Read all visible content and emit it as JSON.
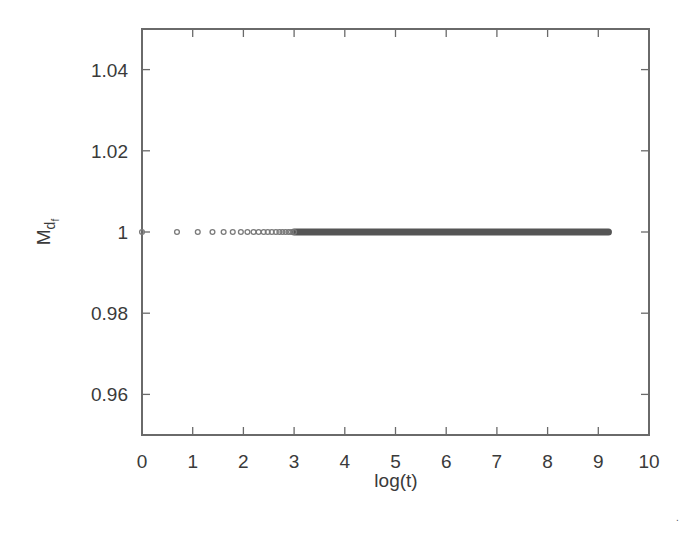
{
  "chart_data": {
    "type": "scatter",
    "title": "",
    "xlabel": "log(t)",
    "ylabel": "M_{d_f}",
    "ylabel_main": "M",
    "ylabel_sub": "d",
    "ylabel_subsub": "f",
    "xlim": [
      0,
      10
    ],
    "ylim": [
      0.95,
      1.05
    ],
    "xticks": [
      0,
      1,
      2,
      3,
      4,
      5,
      6,
      7,
      8,
      9,
      10
    ],
    "xtick_labels": [
      "0",
      "1",
      "2",
      "3",
      "4",
      "5",
      "6",
      "7",
      "8",
      "9",
      "10"
    ],
    "yticks": [
      0.96,
      0.98,
      1.0,
      1.02,
      1.04
    ],
    "ytick_labels": [
      "0.96",
      "0.98",
      "1",
      "1.02",
      "1.04"
    ],
    "grid": false,
    "legend": null,
    "series": [
      {
        "name": "M_df",
        "marker": "open-circle",
        "x": [
          0.0,
          0.69,
          1.1,
          1.39,
          1.61,
          1.79,
          1.95,
          2.08,
          2.2,
          2.3,
          2.4,
          2.48,
          2.56,
          2.64,
          2.71,
          2.77,
          2.83,
          2.89,
          2.94,
          3.0
        ],
        "y": [
          1,
          1,
          1,
          1,
          1,
          1,
          1,
          1,
          1,
          1,
          1,
          1,
          1,
          1,
          1,
          1,
          1,
          1,
          1,
          1
        ],
        "dense_segment": {
          "x_start": 3.0,
          "x_end": 9.2,
          "y": 1
        }
      }
    ],
    "annotations": []
  }
}
